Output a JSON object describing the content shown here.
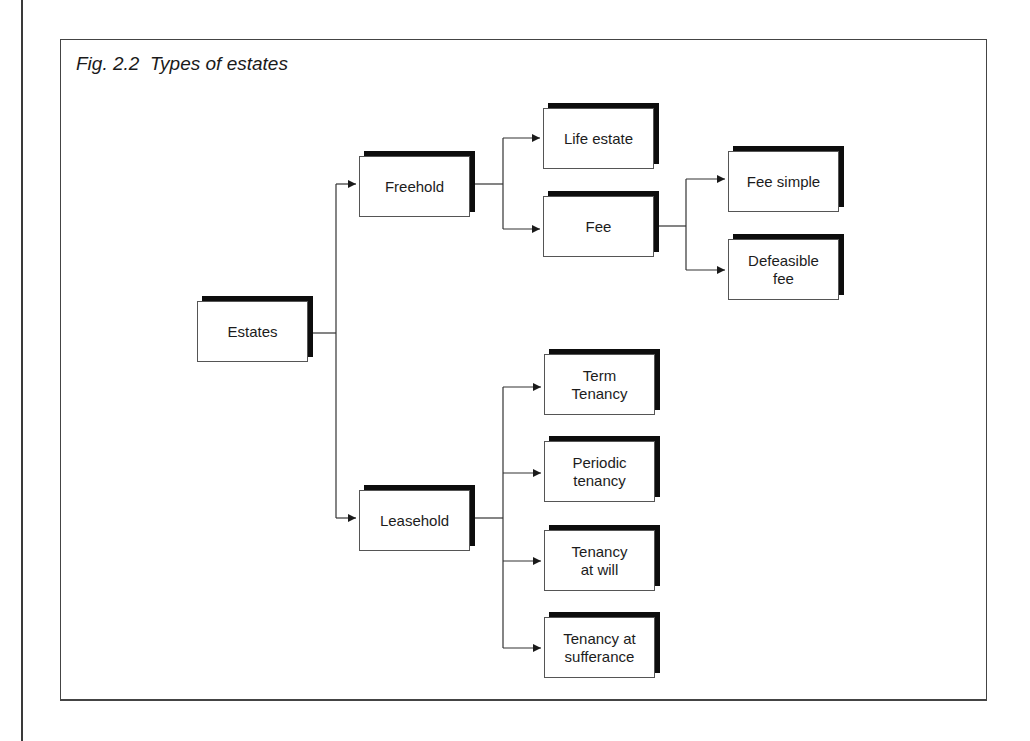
{
  "figure": {
    "title": "Fig. 2.2  Types of estates"
  },
  "nodes": {
    "estates": "Estates",
    "freehold": "Freehold",
    "leasehold": "Leasehold",
    "life_estate": "Life estate",
    "fee": "Fee",
    "fee_simple": "Fee simple",
    "defeasible_fee": "Defeasible\nfee",
    "term_tenancy": "Term\nTenancy",
    "periodic_tenancy": "Periodic\ntenancy",
    "tenancy_at_will": "Tenancy\nat will",
    "tenancy_at_sufferance": "Tenancy at\nsufferance"
  },
  "tree": {
    "Estates": {
      "Freehold": {
        "Life estate": {},
        "Fee": {
          "Fee simple": {},
          "Defeasible fee": {}
        }
      },
      "Leasehold": {
        "Term Tenancy": {},
        "Periodic tenancy": {},
        "Tenancy at will": {},
        "Tenancy at sufferance": {}
      }
    }
  },
  "colors": {
    "line": "#333333",
    "shadow": "#0d0d0d",
    "box_fill": "#ffffff",
    "box_border": "#555555"
  }
}
